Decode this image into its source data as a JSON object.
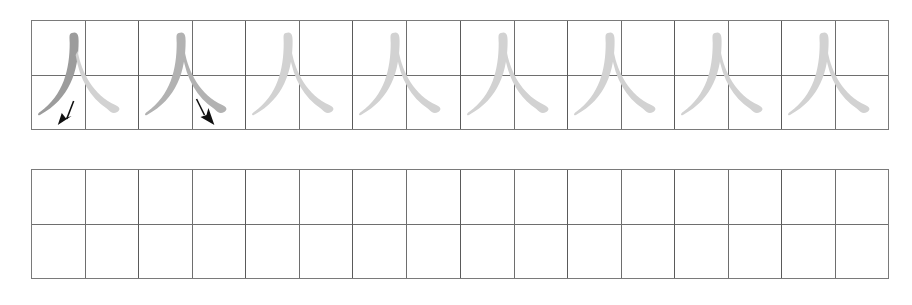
{
  "worksheet": {
    "character": "人",
    "grid_type": "tian-zi-ge",
    "columns": 8,
    "colors": {
      "grid_outer": "#7a7a7a",
      "grid_inner": "#6e6e6e",
      "stroke_dark": "#9c9c9c",
      "stroke_medium": "#b2b2b2",
      "stroke_light": "#d2d2d2",
      "arrow": "#111111"
    },
    "practice_row": {
      "cells": [
        {
          "index": 1,
          "content": "stroke-1-pie",
          "stroke1": "dark",
          "stroke2": "light",
          "arrow": "down-left"
        },
        {
          "index": 2,
          "content": "stroke-2-na",
          "stroke1": "medium",
          "stroke2": "medium",
          "arrow": "down-right"
        },
        {
          "index": 3,
          "content": "trace",
          "stroke1": "light",
          "stroke2": "light",
          "arrow": "none"
        },
        {
          "index": 4,
          "content": "trace",
          "stroke1": "light",
          "stroke2": "light",
          "arrow": "none"
        },
        {
          "index": 5,
          "content": "trace",
          "stroke1": "light",
          "stroke2": "light",
          "arrow": "none"
        },
        {
          "index": 6,
          "content": "trace",
          "stroke1": "light",
          "stroke2": "light",
          "arrow": "none"
        },
        {
          "index": 7,
          "content": "trace",
          "stroke1": "light",
          "stroke2": "light",
          "arrow": "none"
        },
        {
          "index": 8,
          "content": "trace",
          "stroke1": "light",
          "stroke2": "light",
          "arrow": "none"
        }
      ]
    },
    "blank_row": {
      "cells": [
        1,
        2,
        3,
        4,
        5,
        6,
        7,
        8
      ]
    }
  }
}
